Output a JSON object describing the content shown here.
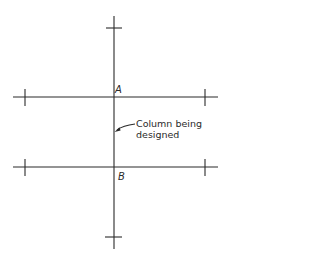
{
  "diagram": {
    "type": "structural-plan",
    "background": "#ffffff",
    "line_color": "#2a2a2a",
    "labels": {
      "point_a": "A",
      "point_b": "B",
      "annotation_line1": "Column being",
      "annotation_line2": "designed"
    },
    "geometry": {
      "column_line": {
        "x": 114,
        "y1": 16,
        "y2": 249
      },
      "beam_top": {
        "y": 97,
        "x1": 13,
        "x2": 218
      },
      "beam_bottom": {
        "y": 167,
        "x1": 13,
        "x2": 218
      },
      "ticks": {
        "column_top": {
          "y": 28,
          "x1": 106,
          "x2": 122
        },
        "column_bottom": {
          "y": 237,
          "x1": 105,
          "x2": 122
        },
        "beam_top_left": {
          "x": 25,
          "y1": 89,
          "y2": 106
        },
        "beam_top_right": {
          "x": 205,
          "y1": 89,
          "y2": 106
        },
        "beam_bottom_left": {
          "x": 25,
          "y1": 159,
          "y2": 176
        },
        "beam_bottom_right": {
          "x": 205,
          "y1": 159,
          "y2": 176
        }
      }
    }
  }
}
